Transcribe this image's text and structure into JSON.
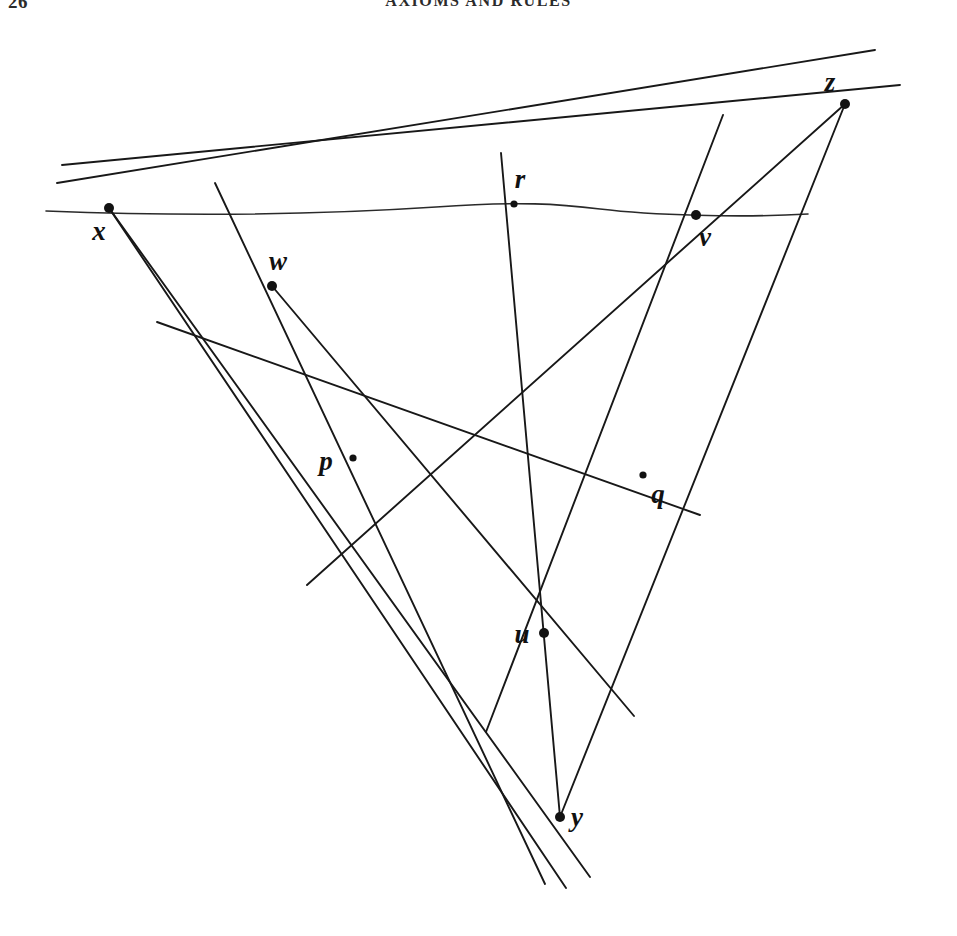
{
  "page": {
    "folio": "26",
    "running_head": "AXIOMS AND RULES"
  },
  "figure": {
    "caption": "",
    "point_labels": {
      "x": "x",
      "w": "w",
      "r": "r",
      "v": "v",
      "z": "z",
      "p": "p",
      "q": "q",
      "u": "u",
      "y": "y"
    }
  },
  "chart_data": {
    "type": "scatter",
    "title": "",
    "xlabel": "",
    "ylabel": "",
    "xlim": [
      0,
      957
    ],
    "ylim": [
      0,
      918
    ],
    "grid": false,
    "legend": "none",
    "ink_color": "#181818",
    "points": [
      {
        "label": "x",
        "x": 109,
        "y": 190,
        "dot": "large",
        "label_dx": -10,
        "label_dy": 26
      },
      {
        "label": "w",
        "x": 272,
        "y": 268,
        "dot": "large",
        "label_dx": 6,
        "label_dy": -22
      },
      {
        "label": "r",
        "x": 514,
        "y": 186,
        "dot": "small",
        "label_dx": 6,
        "label_dy": -22
      },
      {
        "label": "v",
        "x": 696,
        "y": 197,
        "dot": "large",
        "label_dx": 9,
        "label_dy": 25
      },
      {
        "label": "z",
        "x": 845,
        "y": 86,
        "dot": "large",
        "label_dx": -15,
        "label_dy": -19
      },
      {
        "label": "p",
        "x": 353,
        "y": 440,
        "dot": "small",
        "label_dx": -27,
        "label_dy": 6
      },
      {
        "label": "q",
        "x": 643,
        "y": 457,
        "dot": "small",
        "label_dx": 15,
        "label_dy": 22
      },
      {
        "label": "u",
        "x": 544,
        "y": 615,
        "dot": "large",
        "label_dx": -22,
        "label_dy": 4
      },
      {
        "label": "y",
        "x": 560,
        "y": 799,
        "dot": "large",
        "label_dx": 17,
        "label_dy": 3
      }
    ],
    "lines": [
      {
        "name": "horizontal-through-x-and-v",
        "kind": "curve",
        "path": "M 46 193 C 200 199 330 196 436 189 C 520 183 560 186 600 191 C 650 197 740 200 808 196"
      },
      {
        "name": "x-to-z-upper",
        "kind": "segment",
        "x1": 62,
        "y1": 147,
        "x2": 900,
        "y2": 67
      },
      {
        "name": "x-through-w-to-z",
        "kind": "segment",
        "x1": 57,
        "y1": 165,
        "x2": 875,
        "y2": 32
      },
      {
        "name": "x-through-p-to-y",
        "kind": "segment",
        "x1": 109,
        "y1": 190,
        "x2": 590,
        "y2": 859
      },
      {
        "name": "x-through-q-to-y",
        "kind": "segment",
        "x1": 109,
        "y1": 190,
        "x2": 566,
        "y2": 870
      },
      {
        "name": "w-line-down-right-to-q",
        "kind": "segment",
        "x1": 157,
        "y1": 304,
        "x2": 700,
        "y2": 497
      },
      {
        "name": "w-line-to-z",
        "kind": "segment",
        "x1": 215,
        "y1": 165,
        "x2": 545,
        "y2": 866
      },
      {
        "name": "w-through-u-to-lower-right",
        "kind": "segment",
        "x1": 272,
        "y1": 268,
        "x2": 634,
        "y2": 698
      },
      {
        "name": "r-vertical-through-u-to-y",
        "kind": "segment",
        "x1": 501,
        "y1": 135,
        "x2": 560,
        "y2": 799
      },
      {
        "name": "v-down-left-through-u",
        "kind": "segment",
        "x1": 723,
        "y1": 97,
        "x2": 486,
        "y2": 714
      },
      {
        "name": "z-down-through-v-to-y",
        "kind": "segment",
        "x1": 845,
        "y1": 86,
        "x2": 560,
        "y2": 799
      },
      {
        "name": "z-down-left-through-w-to-p",
        "kind": "segment",
        "x1": 845,
        "y1": 86,
        "x2": 307,
        "y2": 567
      }
    ]
  }
}
